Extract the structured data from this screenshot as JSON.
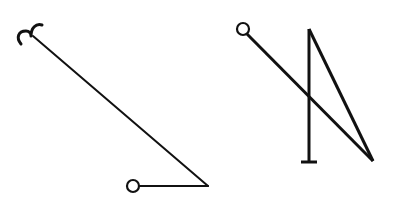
{
  "diagram": {
    "background": "#ffffff",
    "stroke_color": "#111111",
    "figures": [
      {
        "id": "left-figure",
        "description": "Hooked line descending to a horizontal segment ending in an open circle",
        "hook": {
          "cx": 30,
          "cy": 35
        },
        "segments": [
          {
            "x1": 33,
            "y1": 36,
            "x2": 208,
            "y2": 186
          },
          {
            "x1": 208,
            "y1": 186,
            "x2": 140,
            "y2": 186
          }
        ],
        "circle": {
          "cx": 133,
          "cy": 186,
          "r": 6
        }
      },
      {
        "id": "right-figure",
        "description": "Open circle line crossing a vertical stem with T-base, joined at a sharp apex",
        "circle": {
          "cx": 243,
          "cy": 29,
          "r": 6
        },
        "segments": [
          {
            "x1": 247,
            "y1": 34,
            "x2": 373,
            "y2": 161
          },
          {
            "x1": 309,
            "y1": 29,
            "x2": 309,
            "y2": 162
          },
          {
            "x1": 309,
            "y1": 29,
            "x2": 373,
            "y2": 161
          },
          {
            "x1": 301,
            "y1": 162,
            "x2": 317,
            "y2": 162
          }
        ]
      }
    ]
  }
}
